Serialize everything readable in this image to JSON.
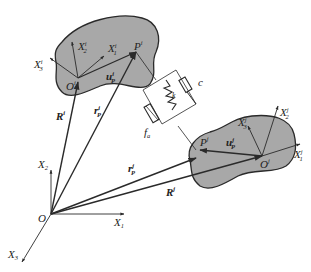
{
  "diagram": {
    "colors": {
      "body_fill": "#a8a8a8",
      "body_stroke": "#2a2a2a",
      "line": "#2a2a2a",
      "background": "#ffffff"
    },
    "global_frame": {
      "origin": "O",
      "axes": [
        {
          "name": "X",
          "sub": "1"
        },
        {
          "name": "X",
          "sub": "2"
        },
        {
          "name": "X",
          "sub": "3"
        }
      ]
    },
    "body_i": {
      "origin": "O",
      "origin_sup": "i",
      "point": "P",
      "point_sup": "i",
      "axes": [
        {
          "name": "X",
          "sub": "1",
          "sup": "i"
        },
        {
          "name": "X",
          "sub": "2",
          "sup": "i"
        },
        {
          "name": "X",
          "sub": "3",
          "sup": "i"
        }
      ],
      "vectors": {
        "R": {
          "name": "R",
          "sup": "i"
        },
        "u": {
          "name": "u",
          "sub": "P",
          "sup": "i"
        },
        "r": {
          "name": "r",
          "sub": "P",
          "sup": "i"
        }
      }
    },
    "body_j": {
      "origin": "O",
      "origin_sup": "j",
      "point": "P",
      "point_sup": "j",
      "axes": [
        {
          "name": "X",
          "sub": "1",
          "sup": "j"
        },
        {
          "name": "X",
          "sub": "2",
          "sup": "j"
        },
        {
          "name": "X",
          "sub": "3",
          "sup": "j"
        }
      ],
      "vectors": {
        "R": {
          "name": "R",
          "sup": "j"
        },
        "u": {
          "name": "u",
          "sub": "P",
          "sup": "j"
        },
        "r": {
          "name": "r",
          "sub": "P",
          "sup": "j"
        }
      }
    },
    "connector": {
      "actuator": {
        "name": "f",
        "sub": "a"
      },
      "spring": {
        "name": "k"
      },
      "damper": {
        "name": "c"
      }
    }
  }
}
